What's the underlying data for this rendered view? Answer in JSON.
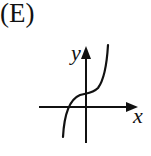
{
  "option": {
    "label": "(E)"
  },
  "graph": {
    "x_axis_label": "x",
    "y_axis_label": "y",
    "curve_description": "increasing cubic with inflection point on positive y-axis, x-intercept left of origin"
  },
  "colors": {
    "ink": "#111111",
    "background": "#ffffff"
  }
}
